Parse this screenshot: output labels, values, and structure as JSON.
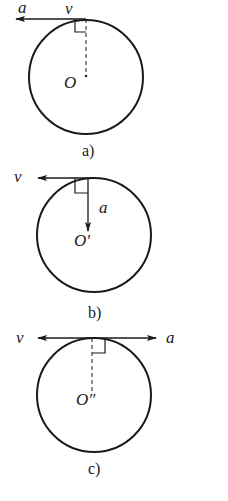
{
  "figures": [
    {
      "id": "a",
      "caption": "a)",
      "center_label": "O",
      "velocity_label": "v",
      "acceleration_label": "a",
      "description": "Acceleration tangent, pointing left, same direction as velocity"
    },
    {
      "id": "b",
      "caption": "b)",
      "center_label": "O′",
      "velocity_label": "v",
      "acceleration_label": "a",
      "description": "Acceleration pointing toward center, perpendicular to velocity"
    },
    {
      "id": "c",
      "caption": "c)",
      "center_label": "O″",
      "velocity_label": "v",
      "acceleration_label": "a",
      "description": "Acceleration tangent, pointing right, opposite to velocity"
    }
  ],
  "colors": {
    "stroke": "#1a1a1a",
    "background": "#ffffff"
  }
}
